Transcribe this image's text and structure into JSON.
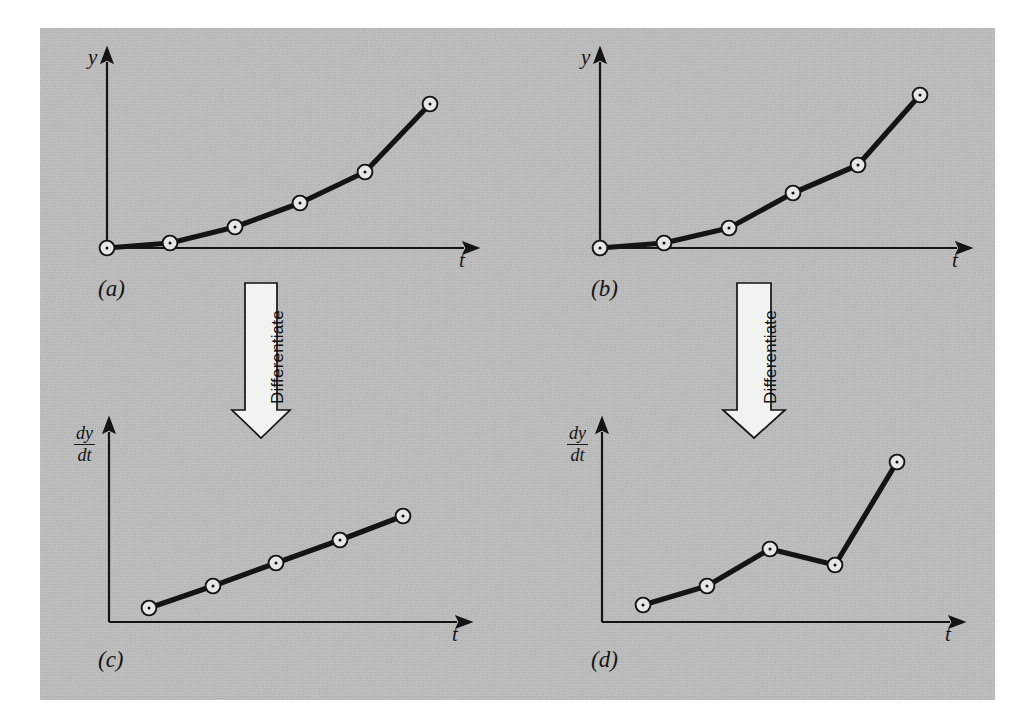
{
  "figure": {
    "background_color": "#bcbcbc",
    "ink_color": "#141414",
    "plate": {
      "x": 40,
      "y": 28,
      "width": 955,
      "height": 672
    }
  },
  "panels": [
    {
      "tag": "(a)",
      "tag_pos": {
        "x": 98,
        "y": 277
      },
      "y_axis_label": "y",
      "y_axis_label_kind": "plain",
      "y_axis_label_pos": {
        "x": 88,
        "y": 57
      },
      "x_axis_label": "t",
      "x_axis_label_pos": {
        "x": 459,
        "y": 257
      },
      "origin": {
        "x": 107,
        "y": 248
      },
      "y_axis_top": {
        "x": 107,
        "y": 62
      },
      "x_axis_end": {
        "x": 464,
        "y": 248
      }
    },
    {
      "tag": "(b)",
      "tag_pos": {
        "x": 591,
        "y": 277
      },
      "y_axis_label": "y",
      "y_axis_label_kind": "plain",
      "y_axis_label_pos": {
        "x": 581,
        "y": 57
      },
      "x_axis_label": "t",
      "x_axis_label_pos": {
        "x": 952,
        "y": 257
      },
      "origin": {
        "x": 600,
        "y": 248
      },
      "y_axis_top": {
        "x": 600,
        "y": 62
      },
      "x_axis_end": {
        "x": 957,
        "y": 248
      }
    },
    {
      "tag": "(c)",
      "tag_pos": {
        "x": 98,
        "y": 648
      },
      "y_axis_label_kind": "fraction",
      "y_axis_label_num": "dy",
      "y_axis_label_den": "dt",
      "y_axis_label_pos": {
        "x": 74,
        "y": 424
      },
      "x_axis_label": "t",
      "x_axis_label_pos": {
        "x": 452,
        "y": 631
      },
      "origin": {
        "x": 109,
        "y": 622
      },
      "y_axis_top": {
        "x": 109,
        "y": 432
      },
      "x_axis_end": {
        "x": 457,
        "y": 622
      }
    },
    {
      "tag": "(d)",
      "tag_pos": {
        "x": 591,
        "y": 648
      },
      "y_axis_label_kind": "fraction",
      "y_axis_label_num": "dy",
      "y_axis_label_den": "dt",
      "y_axis_label_pos": {
        "x": 567,
        "y": 424
      },
      "x_axis_label": "t",
      "x_axis_label_pos": {
        "x": 945,
        "y": 631
      },
      "origin": {
        "x": 602,
        "y": 622
      },
      "y_axis_top": {
        "x": 602,
        "y": 432
      },
      "x_axis_end": {
        "x": 950,
        "y": 622
      }
    }
  ],
  "arrows": [
    {
      "label": "Differentiate",
      "shaft_left": 245,
      "shaft_right": 277,
      "top": 283,
      "head_top": 410,
      "head_left": 232,
      "head_right": 290,
      "tip_y": 438,
      "caption_anchor": {
        "x": 268,
        "y": 404
      }
    },
    {
      "label": "Differentiate",
      "shaft_left": 737,
      "shaft_right": 771,
      "top": 283,
      "head_top": 410,
      "head_left": 723,
      "head_right": 785,
      "tip_y": 438,
      "caption_anchor": {
        "x": 761,
        "y": 404
      }
    }
  ],
  "chart_data": [
    {
      "type": "line",
      "id": "panel-a",
      "title": "(a)",
      "xlabel": "t",
      "ylabel": "y",
      "description": "Smooth, accurate data: y increases smoothly with t",
      "marker": "circle-with-center-dot",
      "n_points": 6,
      "x": [
        0,
        1,
        2,
        3,
        4,
        5
      ],
      "y": [
        0.0,
        0.1,
        0.42,
        0.9,
        1.52,
        2.88
      ],
      "points_px": [
        {
          "x": 107,
          "y": 248
        },
        {
          "x": 170,
          "y": 243
        },
        {
          "x": 235,
          "y": 227
        },
        {
          "x": 300,
          "y": 203
        },
        {
          "x": 365,
          "y": 172
        },
        {
          "x": 430,
          "y": 104
        }
      ],
      "grid": false,
      "legend": "none"
    },
    {
      "type": "line",
      "id": "panel-b",
      "title": "(b)",
      "xlabel": "t",
      "ylabel": "y",
      "description": "Slightly noisy data: y increases with t but with small scatter",
      "marker": "circle-with-center-dot",
      "n_points": 6,
      "x": [
        0,
        1,
        2,
        3,
        4,
        5
      ],
      "y": [
        0.0,
        0.1,
        0.4,
        1.12,
        1.66,
        3.12
      ],
      "points_px": [
        {
          "x": 600,
          "y": 248
        },
        {
          "x": 664,
          "y": 243
        },
        {
          "x": 729,
          "y": 228
        },
        {
          "x": 793,
          "y": 193
        },
        {
          "x": 858,
          "y": 165
        },
        {
          "x": 920,
          "y": 95
        }
      ],
      "grid": false,
      "legend": "none"
    },
    {
      "type": "line",
      "id": "panel-c",
      "title": "(c)",
      "xlabel": "t",
      "ylabel": "dy/dt",
      "description": "Derivative of smooth data (a): a clean, nearly straight increasing line",
      "marker": "circle-with-center-dot",
      "n_points": 5,
      "x": [
        0.5,
        1.5,
        2.5,
        3.5,
        4.5
      ],
      "y": [
        0.15,
        0.38,
        0.62,
        0.86,
        1.11
      ],
      "points_px": [
        {
          "x": 149,
          "y": 608
        },
        {
          "x": 213,
          "y": 586
        },
        {
          "x": 276,
          "y": 563
        },
        {
          "x": 340,
          "y": 540
        },
        {
          "x": 403,
          "y": 516
        }
      ],
      "grid": false,
      "legend": "none"
    },
    {
      "type": "line",
      "id": "panel-d",
      "title": "(d)",
      "xlabel": "t",
      "ylabel": "dy/dt",
      "description": "Derivative of noisy data (b): amplified scatter, jagged with a dip then a sharp rise",
      "marker": "circle-with-center-dot",
      "n_points": 5,
      "x": [
        0.5,
        1.5,
        2.5,
        3.5,
        4.5
      ],
      "y": [
        0.17,
        0.36,
        0.73,
        0.57,
        1.6
      ],
      "points_px": [
        {
          "x": 643,
          "y": 605
        },
        {
          "x": 707,
          "y": 586
        },
        {
          "x": 770,
          "y": 549
        },
        {
          "x": 835,
          "y": 565
        },
        {
          "x": 897,
          "y": 462
        }
      ],
      "grid": false,
      "legend": "none"
    }
  ]
}
